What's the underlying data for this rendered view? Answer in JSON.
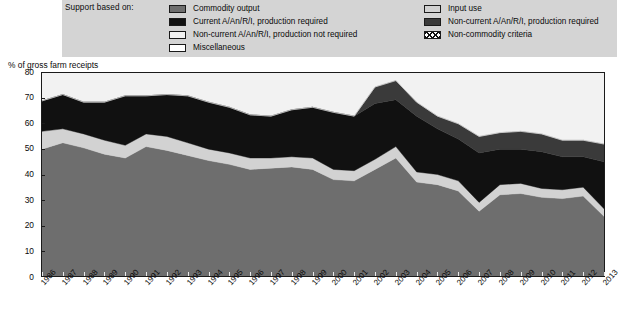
{
  "legend": {
    "title": "Support based on:",
    "left_items": [
      {
        "label": "Commodity output",
        "swatch": "sw-commodity",
        "icon": "legend-swatch-commodity-output"
      },
      {
        "label": "Current A/An/R/I, production required",
        "swatch": "sw-current",
        "icon": "legend-swatch-current-required"
      },
      {
        "label": "Non-current A/An/R/I, production not required",
        "swatch": "sw-noncur-nreq",
        "icon": "legend-swatch-noncurrent-not-required"
      },
      {
        "label": "Miscellaneous",
        "swatch": "sw-misc",
        "icon": "legend-swatch-miscellaneous"
      }
    ],
    "right_items": [
      {
        "label": "Input use",
        "swatch": "sw-inputuse",
        "icon": "legend-swatch-input-use"
      },
      {
        "label": "Non-current A/An/R/I, production required",
        "swatch": "sw-noncur-req",
        "icon": "legend-swatch-noncurrent-required"
      },
      {
        "label": "Non-commodity criteria",
        "swatch": "sw-noncommodity",
        "icon": "legend-swatch-non-commodity-criteria"
      }
    ]
  },
  "colors": {
    "commodity_output": "#6e6e6e",
    "input_use": "#d2d2d2",
    "current_required": "#111111",
    "noncurrent_required": "#3a3a3a",
    "noncurrent_not_required": "#f2f2f2",
    "non_commodity_criteria": "#ffffff",
    "miscellaneous": "#ffffff",
    "plot_background": "#f2f2f2",
    "legend_background": "#d4d4d4",
    "axis": "#1b1b1b"
  },
  "chart_data": {
    "type": "area",
    "stacked": true,
    "title": "",
    "xlabel": "",
    "ylabel": "% of gross farm receipts",
    "ylim": [
      0,
      80
    ],
    "yticks": [
      0,
      10,
      20,
      30,
      40,
      50,
      60,
      70,
      80
    ],
    "grid": false,
    "legend_position": "top",
    "categories": [
      "1986",
      "1987",
      "1988",
      "1989",
      "1990",
      "1991",
      "1992",
      "1993",
      "1994",
      "1995",
      "1996",
      "1997",
      "1998",
      "1999",
      "2000",
      "2001",
      "2002",
      "2003",
      "2004",
      "2005",
      "2006",
      "2007",
      "2008",
      "2009",
      "2010",
      "2011",
      "2012",
      "2013"
    ],
    "series": [
      {
        "name": "Commodity output",
        "color": "#6e6e6e",
        "values": [
          50.0,
          52.5,
          50.5,
          48.0,
          46.5,
          51.0,
          49.5,
          47.5,
          45.5,
          44.0,
          42.0,
          42.5,
          43.0,
          42.0,
          38.0,
          37.5,
          42.0,
          46.5,
          37.0,
          36.0,
          33.5,
          25.5,
          32.0,
          32.5,
          31.0,
          30.5,
          31.5,
          23.5
        ]
      },
      {
        "name": "Input use",
        "color": "#d2d2d2",
        "values": [
          7.0,
          5.5,
          5.5,
          5.5,
          5.0,
          5.0,
          5.5,
          5.0,
          4.5,
          4.5,
          4.5,
          4.0,
          4.0,
          4.5,
          4.0,
          4.0,
          4.0,
          4.5,
          4.0,
          4.0,
          4.0,
          3.5,
          4.0,
          4.0,
          3.5,
          3.5,
          3.5,
          3.0
        ]
      },
      {
        "name": "Current A/An/R/I, production required",
        "color": "#111111",
        "values": [
          12.0,
          13.5,
          12.5,
          15.0,
          19.5,
          15.0,
          16.5,
          18.5,
          18.5,
          18.0,
          17.0,
          16.5,
          18.5,
          20.0,
          22.5,
          21.5,
          22.0,
          18.5,
          22.0,
          18.0,
          16.5,
          19.5,
          14.0,
          13.5,
          14.5,
          13.0,
          12.0,
          18.5
        ]
      },
      {
        "name": "Non-current A/An/R/I, production required",
        "color": "#3a3a3a",
        "values": [
          0.0,
          0.0,
          0.0,
          0.0,
          0.0,
          0.0,
          0.0,
          0.0,
          0.0,
          0.0,
          0.0,
          0.0,
          0.0,
          0.0,
          0.0,
          0.0,
          6.5,
          7.5,
          5.5,
          5.0,
          6.0,
          6.5,
          6.5,
          7.0,
          7.0,
          6.5,
          6.5,
          7.0
        ]
      },
      {
        "name": "Non-current A/An/R/I, production not required",
        "color": "#f2f2f2",
        "values": [
          0.0,
          0.0,
          0.0,
          0.0,
          0.0,
          0.0,
          0.0,
          0.0,
          0.0,
          0.0,
          0.0,
          0.0,
          0.0,
          0.0,
          0.0,
          0.0,
          0.0,
          0.0,
          0.0,
          0.0,
          0.0,
          0.0,
          0.0,
          0.0,
          0.0,
          0.0,
          0.0,
          0.0
        ]
      }
    ],
    "totals": [
      69.0,
      71.5,
      68.5,
      68.5,
      71.0,
      71.0,
      71.5,
      71.0,
      68.5,
      66.5,
      63.5,
      63.0,
      65.5,
      66.5,
      64.5,
      63.0,
      74.5,
      77.0,
      68.5,
      63.0,
      60.0,
      55.0,
      56.5,
      57.0,
      56.0,
      53.5,
      53.5,
      52.0
    ]
  }
}
